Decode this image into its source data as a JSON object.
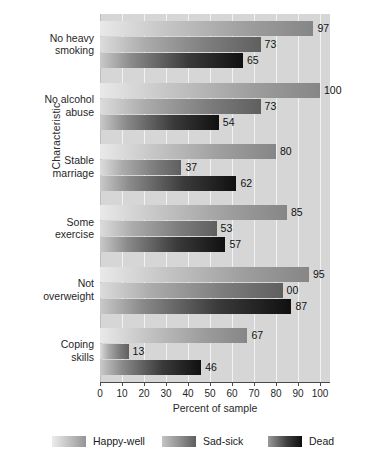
{
  "chart_data": {
    "type": "bar",
    "orientation": "horizontal",
    "title": "",
    "xlabel": "Percent of sample",
    "ylabel": "Characteristic",
    "xlim": [
      0,
      100
    ],
    "xticks": [
      0,
      10,
      20,
      30,
      40,
      50,
      60,
      70,
      80,
      90,
      100
    ],
    "grid": true,
    "grid_axis": "x",
    "legend_position": "bottom",
    "categories": [
      "No heavy smoking",
      "No alcohol abuse",
      "Stable marriage",
      "Some exercise",
      "Not overweight",
      "Coping skills"
    ],
    "category_lines": [
      [
        "No heavy",
        "smoking"
      ],
      [
        "No alcohol",
        "abuse"
      ],
      [
        "Stable",
        "marriage"
      ],
      [
        "Some",
        "exercise"
      ],
      [
        "Not",
        "overweight"
      ],
      [
        "Coping",
        "skills"
      ]
    ],
    "series": [
      {
        "name": "Happy-well",
        "color": "#868686",
        "values": [
          97,
          100,
          80,
          85,
          95,
          67
        ],
        "labels": [
          "97",
          "100",
          "80",
          "85",
          "95",
          "67"
        ]
      },
      {
        "name": "Sad-sick",
        "color": "#5f5f5f",
        "values": [
          73,
          73,
          37,
          53,
          83,
          13
        ],
        "labels": [
          "73",
          "73",
          "37",
          "53",
          "00",
          "13"
        ]
      },
      {
        "name": "Dead",
        "color": "#101010",
        "values": [
          65,
          54,
          62,
          57,
          87,
          46
        ],
        "labels": [
          "65",
          "54",
          "62",
          "57",
          "87",
          "46"
        ]
      }
    ]
  },
  "colors": {
    "plot_background": "#d6d6d6",
    "gridline": "#f2f2f2",
    "axis": "#4a4a4a",
    "page_background": "#ffffff"
  }
}
